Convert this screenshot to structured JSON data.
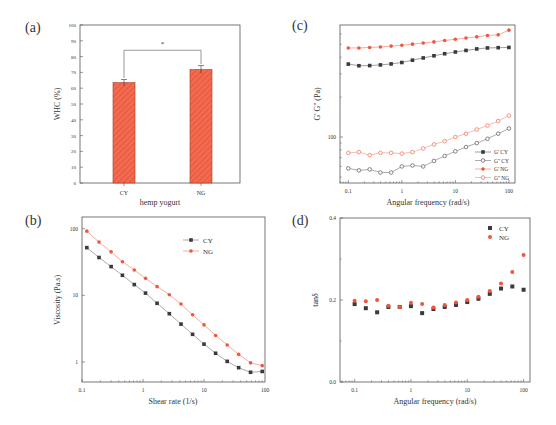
{
  "colors": {
    "cy": "#3a3a3a",
    "ng": "#f0563a",
    "bar": "#f26a4f",
    "axis": "#555555"
  },
  "chart_data": [
    {
      "panel": "(a)",
      "type": "bar",
      "title": "",
      "xlabel": "hemp yogurt",
      "ylabel": "WHC (%)",
      "ylim": [
        0,
        100
      ],
      "yticks": [
        0,
        10,
        20,
        30,
        40,
        50,
        60,
        70,
        80,
        90,
        100
      ],
      "categories": [
        "CY",
        "NG"
      ],
      "values": [
        63.5,
        71.8
      ],
      "errors": [
        2,
        2.5
      ],
      "annotation": "*",
      "pattern": "hatched"
    },
    {
      "panel": "(b)",
      "type": "line",
      "xlabel": "Shear rate (1/s)",
      "ylabel": "Viscosity (Pa.s)",
      "xscale": "log",
      "yscale": "log",
      "xlim": [
        0.1,
        100
      ],
      "ylim": [
        0.5,
        150
      ],
      "xticks": [
        "0.1",
        "1",
        "10",
        "100"
      ],
      "yticks": [
        "1",
        "10",
        "100"
      ],
      "legend": [
        "CY",
        "NG"
      ],
      "x": [
        0.12,
        0.19,
        0.3,
        0.46,
        0.72,
        1.1,
        1.7,
        2.7,
        4.2,
        6.5,
        10,
        15.5,
        24,
        37,
        58,
        90
      ],
      "series": [
        {
          "name": "CY",
          "values": [
            52,
            37,
            27,
            20,
            14.5,
            10.8,
            7.6,
            5.3,
            3.7,
            2.6,
            1.85,
            1.35,
            1.02,
            0.82,
            0.7,
            0.72
          ]
        },
        {
          "name": "NG",
          "values": [
            92,
            63,
            45,
            32,
            24,
            18,
            13.5,
            10.2,
            7.4,
            5.1,
            3.6,
            2.5,
            1.8,
            1.3,
            0.97,
            0.88
          ]
        }
      ]
    },
    {
      "panel": "(c)",
      "type": "line",
      "xlabel": "Angular frequency (rad/s)",
      "ylabel": "G' G'' (Pa)",
      "xscale": "log",
      "yscale": "log",
      "xticks": [
        "0.1",
        "1",
        "10",
        "100"
      ],
      "yticks": [
        "100"
      ],
      "legend": [
        "G' CY",
        "G'' CY",
        "G' NG",
        "G'' NG"
      ],
      "x": [
        0.1,
        0.158,
        0.251,
        0.398,
        0.631,
        1,
        1.58,
        2.51,
        3.98,
        6.31,
        10,
        15.8,
        25.1,
        39.8,
        63.1,
        100
      ],
      "series": [
        {
          "name": "G' CY",
          "marker": "filled-square",
          "values": [
            355,
            345,
            346,
            350,
            356,
            365,
            380,
            395,
            410,
            425,
            438,
            450,
            462,
            470,
            472,
            474
          ]
        },
        {
          "name": "G'' CY",
          "marker": "open-circle",
          "values": [
            58,
            56,
            57,
            54,
            54,
            60,
            61,
            60,
            66,
            72,
            78,
            84,
            90,
            97,
            106,
            116
          ]
        },
        {
          "name": "G' NG",
          "marker": "filled-circle",
          "values": [
            470,
            470,
            474,
            478,
            485,
            493,
            502,
            512,
            522,
            535,
            546,
            558,
            570,
            584,
            590,
            640
          ]
        },
        {
          "name": "G'' NG",
          "marker": "open-circle",
          "values": [
            76,
            77,
            73,
            76,
            76,
            75,
            77,
            82,
            88,
            93,
            100,
            106,
            114,
            122,
            132,
            145
          ]
        }
      ]
    },
    {
      "panel": "(d)",
      "type": "scatter",
      "xlabel": "Angular frequency (rad/s)",
      "ylabel": "tanδ",
      "xscale": "log",
      "ylim": [
        0.0,
        0.4
      ],
      "xticks": [
        "0.1",
        "1",
        "10",
        "100"
      ],
      "yticks": [
        "0.0",
        "0.2",
        "0.4"
      ],
      "legend": [
        "CY",
        "NG"
      ],
      "x": [
        0.1,
        0.158,
        0.251,
        0.398,
        0.631,
        1,
        1.58,
        2.51,
        3.98,
        6.31,
        10,
        15.8,
        25.1,
        39.8,
        63.1,
        100
      ],
      "series": [
        {
          "name": "CY",
          "values": [
            0.19,
            0.18,
            0.17,
            0.183,
            0.183,
            0.185,
            0.168,
            0.178,
            0.183,
            0.188,
            0.195,
            0.203,
            0.215,
            0.228,
            0.233,
            0.225
          ]
        },
        {
          "name": "NG",
          "values": [
            0.198,
            0.197,
            0.2,
            0.186,
            0.183,
            0.193,
            0.19,
            0.182,
            0.188,
            0.194,
            0.2,
            0.208,
            0.222,
            0.24,
            0.268,
            0.31
          ]
        }
      ]
    }
  ],
  "panels": {
    "a": {
      "label": "(a)",
      "xlabel": "hemp yogurt",
      "ylabel": "WHC (%)",
      "sig": "*"
    },
    "b": {
      "label": "(b)",
      "xlabel": "Shear rate (1/s)",
      "ylabel": "Viscosity (Pa.s)",
      "legend": [
        "CY",
        "NG"
      ]
    },
    "c": {
      "label": "(c)",
      "xlabel": "Angular frequency (rad/s)",
      "ylabel": "G' G'' (Pa)",
      "legend": [
        "G' CY",
        "G'' CY",
        "G' NG",
        "G'' NG"
      ]
    },
    "d": {
      "label": "(d)",
      "xlabel": "Angular frequency (rad/s)",
      "ylabel": "tanδ",
      "legend": [
        "CY",
        "NG"
      ]
    }
  }
}
